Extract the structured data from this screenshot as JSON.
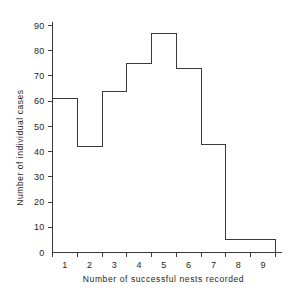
{
  "chart_data": {
    "type": "bar",
    "title": "",
    "subtitle": "",
    "xlabel": "Number of successful nests recorded",
    "ylabel": "Number of individual cases",
    "categories": [
      "1",
      "2",
      "3",
      "4",
      "5",
      "6",
      "7",
      "8",
      "9"
    ],
    "values": [
      61,
      42,
      64,
      75,
      87,
      73,
      43,
      5,
      5
    ],
    "series": [
      {
        "name": "Number of individual cases",
        "values": [
          61,
          42,
          64,
          75,
          87,
          73,
          43,
          5,
          5
        ]
      }
    ],
    "ylim": [
      0,
      90
    ],
    "xlim": [
      0.5,
      9.5
    ],
    "yticks": [
      0,
      10,
      20,
      30,
      40,
      50,
      60,
      70,
      80,
      90
    ],
    "ytick_labels": [
      "0",
      "10",
      "20",
      "30",
      "40",
      "50",
      "60",
      "70",
      "80",
      "90"
    ],
    "xtick_labels": [
      "1",
      "2",
      "3",
      "4",
      "5",
      "6",
      "7",
      "8",
      "9"
    ],
    "grid": false,
    "legend": false,
    "legend_position": "none",
    "bar_style": "outline",
    "bar_gap": 0,
    "annotations": []
  },
  "style": {
    "background": "#ffffff",
    "line_color": "#3a3a3a",
    "text_color": "#262626",
    "bar_fill": "none"
  }
}
